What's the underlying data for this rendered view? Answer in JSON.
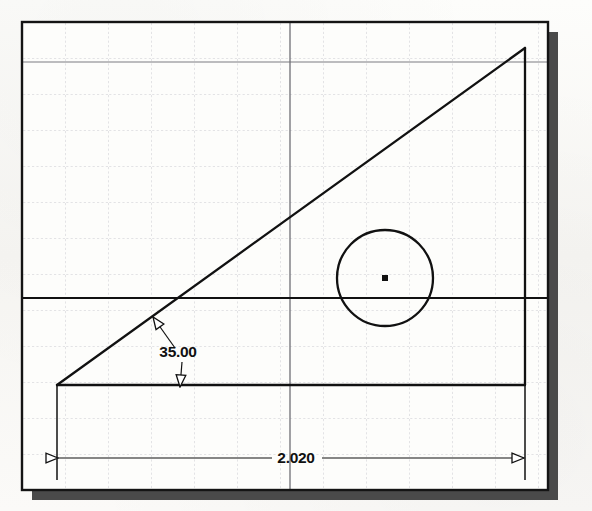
{
  "document": {
    "kind": "cad-sketch-drawing",
    "background_color": "#fbfaf8",
    "frame_color": "#141414",
    "shadow_color": "#4a4a4a",
    "grid_color": "#c9c9cf",
    "geometry_color": "#111111",
    "construction_color": "#6f6f74"
  },
  "frame": {
    "x": 22,
    "y": 22,
    "width": 526,
    "height": 468,
    "stroke_width": 2.4,
    "shadow_offset_x": 10,
    "shadow_offset_y": 10
  },
  "grid": {
    "spacing_x": 43,
    "spacing_y": 36,
    "style": "dotted",
    "visible": true
  },
  "construction_lines": [
    {
      "name": "horizontal-light",
      "orientation": "horizontal",
      "position": 62,
      "weight": "light"
    },
    {
      "name": "vertical-light",
      "orientation": "vertical",
      "position": 290,
      "weight": "light"
    },
    {
      "name": "horizontal-heavy",
      "orientation": "horizontal",
      "position": 298,
      "weight": "heavy"
    }
  ],
  "shapes": {
    "triangle": {
      "name": "right-triangle",
      "apex_left": {
        "x": 57,
        "y": 385
      },
      "apex_top_right": {
        "x": 525,
        "y": 48
      },
      "apex_bottom_right": {
        "x": 525,
        "y": 385
      }
    },
    "circle": {
      "name": "circle",
      "center": {
        "x": 385,
        "y": 278
      },
      "radius": 48,
      "center_mark": "filled-square"
    }
  },
  "dimensions": {
    "angular": {
      "label": "35.00",
      "text_x": 178,
      "text_y": 357,
      "leader_from": {
        "x": 152,
        "y": 316
      },
      "leader_to": {
        "x": 180,
        "y": 388
      },
      "arrow_style": "hollow-triangle"
    },
    "linear": {
      "label": "2.020",
      "text_x": 296,
      "text_y": 463,
      "line_y": 458,
      "start_x": 57,
      "end_x": 525,
      "arrow_style": "hollow-triangle",
      "extension_top_left_y": 385,
      "extension_top_right_y": 385
    }
  }
}
